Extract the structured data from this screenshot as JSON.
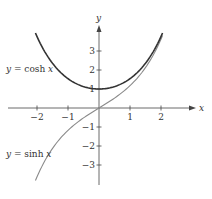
{
  "chart_data": {
    "type": "line",
    "title": "",
    "xlabel": "x",
    "ylabel": "y",
    "xlim": [
      -2.8,
      3.1
    ],
    "ylim": [
      -4.1,
      4.2
    ],
    "grid": false,
    "x_ticks": [
      -2,
      -1,
      1,
      2
    ],
    "y_ticks": [
      3,
      2,
      1,
      -1,
      -2,
      -3
    ],
    "x_tick_labels": [
      "−2",
      "−1",
      "1",
      "2"
    ],
    "y_tick_labels": [
      "3",
      "2",
      "1",
      "−1",
      "−2",
      "−3"
    ],
    "series": [
      {
        "name": "y = cosh x",
        "function": "cosh",
        "color": "#333333",
        "x_range": [
          -2.05,
          2.05
        ],
        "points": [
          [
            -2,
            3.76
          ],
          [
            -1,
            1.54
          ],
          [
            0,
            1
          ],
          [
            1,
            1.54
          ],
          [
            2,
            3.76
          ]
        ]
      },
      {
        "name": "y = sinh x",
        "function": "sinh",
        "color": "#8a8a8a",
        "x_range": [
          -2.05,
          2.05
        ],
        "points": [
          [
            -2,
            -3.63
          ],
          [
            -1,
            -1.18
          ],
          [
            0,
            0
          ],
          [
            1,
            1.18
          ],
          [
            2,
            3.63
          ]
        ]
      }
    ],
    "annotations": [
      {
        "text_pre": "y = ",
        "text_fn": "cosh ",
        "text_var": "x",
        "near": "cosh-curve-left"
      },
      {
        "text_pre": "y = ",
        "text_fn": "sinh ",
        "text_var": "x",
        "near": "sinh-curve-left"
      }
    ]
  },
  "axes": {
    "x_label": "x",
    "y_label": "y"
  },
  "labels": {
    "cosh": {
      "pre": "y = ",
      "fn": "cosh ",
      "var": "x"
    },
    "sinh": {
      "pre": "y = ",
      "fn": "sinh ",
      "var": "x"
    }
  }
}
